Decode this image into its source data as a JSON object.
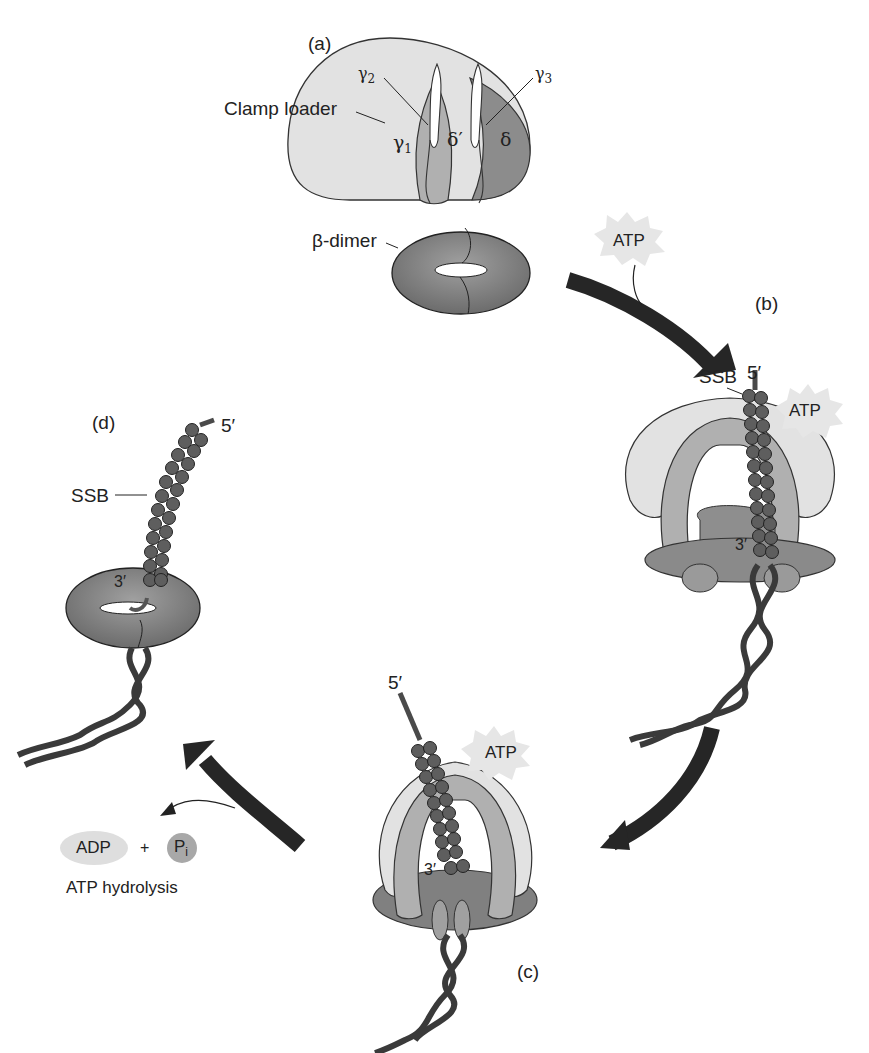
{
  "panels": {
    "a": {
      "label": "(a)",
      "clamp_loader_label": "Clamp loader",
      "subunits": {
        "gamma1": "γ",
        "gamma1_sub": "1",
        "gamma2": "γ",
        "gamma2_sub": "2",
        "gamma3": "γ",
        "gamma3_sub": "3",
        "delta_prime": "δ′",
        "delta": "δ"
      },
      "beta_dimer_label": "β-dimer"
    },
    "b": {
      "label": "(b)",
      "atp_free": "ATP",
      "atp_bound": "ATP",
      "ssb_label": "SSB",
      "five_prime": "5′",
      "three_prime": "3′"
    },
    "c": {
      "label": "(c)",
      "atp_bound": "ATP",
      "five_prime": "5′",
      "three_prime": "3′"
    },
    "d": {
      "label": "(d)",
      "ssb_label": "SSB",
      "five_prime": "5′",
      "three_prime": "3′"
    }
  },
  "hydrolysis": {
    "adp": "ADP",
    "plus": "+",
    "pi": "P",
    "pi_sub": "i",
    "caption": "ATP hydrolysis"
  },
  "colors": {
    "light_subunit": "#e2e2e2",
    "mid_subunit": "#b4b4b4",
    "dark_subunit": "#8a8a8a",
    "beta_clamp": "#7d7d7d",
    "ssb_bead": "#5e5e5e",
    "arrow": "#262626",
    "atp_burst": "#e6e6e6",
    "adp_oval": "#dedede",
    "pi_circle": "#a8a8a8"
  }
}
